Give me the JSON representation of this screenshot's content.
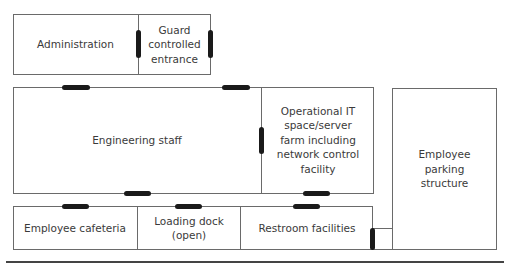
{
  "diagram": {
    "type": "floor-plan",
    "rooms": [
      {
        "id": "administration",
        "label": "Administration"
      },
      {
        "id": "guard",
        "label": "Guard\ncontrolled\nentrance"
      },
      {
        "id": "engineering",
        "label": "Engineering staff"
      },
      {
        "id": "it",
        "label": "Operational IT\nspace/server\nfarm including\nnetwork control\nfacility"
      },
      {
        "id": "parking",
        "label": "Employee\nparking\nstructure"
      },
      {
        "id": "cafeteria",
        "label": "Employee cafeteria"
      },
      {
        "id": "loading",
        "label": "Loading dock\n(open)"
      },
      {
        "id": "restroom",
        "label": "Restroom facilities"
      }
    ],
    "colors": {
      "wall": "#6a6a6a",
      "door": "#1a1a1a",
      "text": "#3a3a3a"
    }
  }
}
